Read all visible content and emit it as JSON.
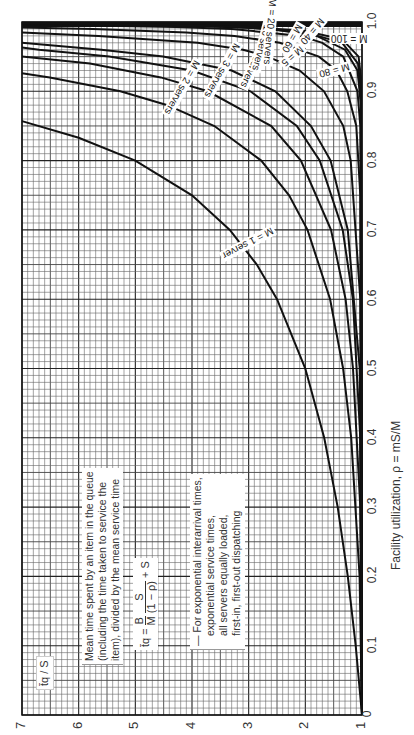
{
  "chart_data": {
    "type": "line",
    "title": "Mean time spent by an item in the queue (including the time taken to service the item), divided by the mean service time",
    "orientation": "rotated-90-ccw",
    "xlabel": "Facility utilization, ρ = mS/M",
    "ylabel": "t̄q / S",
    "xlim": [
      0,
      1.0
    ],
    "ylim": [
      1,
      7
    ],
    "x_ticks": [
      "0",
      "0.1",
      "0.2",
      "0.3",
      "0.4",
      "0.5",
      "0.6",
      "0.7",
      "0.8",
      "0.9",
      "1.0"
    ],
    "y_ticks": [
      "1",
      "2",
      "3",
      "4",
      "5",
      "6",
      "7"
    ],
    "grid": true,
    "formula": {
      "lhs": "t̄q",
      "eq": "=",
      "b_over_m_num": "B",
      "b_over_m_den": "M",
      "s_over_num": "S",
      "s_over_den": "(1 − ρ)",
      "plus": "+ S"
    },
    "assumptions": [
      "For exponential interarrival times,",
      "exponential service times,",
      "all servers equally loaded,",
      "first-in, first-out dispatching"
    ],
    "description_lines": [
      "Mean time spent by an item in the queue",
      "(including the time taken to service the",
      "item), divided by the mean service time"
    ],
    "series": [
      {
        "name": "M = 1 server",
        "label": "M = 1 server",
        "x": [
          0,
          0.1,
          0.2,
          0.3,
          0.4,
          0.5,
          0.6,
          0.65,
          0.7,
          0.75,
          0.8,
          0.833,
          0.857
        ],
        "y": [
          1,
          1.111,
          1.25,
          1.429,
          1.667,
          2.0,
          2.5,
          2.857,
          3.333,
          4.0,
          5.0,
          6.0,
          7.0
        ]
      },
      {
        "name": "M = 2 servers",
        "label": "M = 2 servers",
        "x": [
          0,
          0.2,
          0.4,
          0.5,
          0.6,
          0.7,
          0.75,
          0.8,
          0.85,
          0.88,
          0.9,
          0.92,
          0.926
        ],
        "y": [
          1,
          1.042,
          1.19,
          1.333,
          1.563,
          1.961,
          2.286,
          2.778,
          3.604,
          4.433,
          5.263,
          6.51,
          7.0
        ]
      },
      {
        "name": "M = 3 servers",
        "label": "M = 3 servers",
        "x": [
          0,
          0.3,
          0.5,
          0.6,
          0.7,
          0.8,
          0.85,
          0.9,
          0.92,
          0.94,
          0.95
        ],
        "y": [
          1,
          1.03,
          1.158,
          1.29,
          1.547,
          2.079,
          2.6,
          3.72,
          4.55,
          5.8,
          7.05
        ]
      },
      {
        "name": "M = 4 servers",
        "label": "M = 4 servers",
        "x": [
          0,
          0.4,
          0.6,
          0.7,
          0.8,
          0.85,
          0.9,
          0.93,
          0.95,
          0.96,
          0.963
        ],
        "y": [
          1,
          1.03,
          1.16,
          1.34,
          1.745,
          2.15,
          2.97,
          4.0,
          5.46,
          6.7,
          7.0
        ]
      },
      {
        "name": "M = 5",
        "label": "M = 5",
        "x": [
          0,
          0.5,
          0.7,
          0.8,
          0.85,
          0.9,
          0.93,
          0.95,
          0.96,
          0.97
        ],
        "y": [
          1,
          1.04,
          1.25,
          1.554,
          1.9,
          2.53,
          3.3,
          4.51,
          5.6,
          7.17
        ]
      },
      {
        "name": "M = 10 servers",
        "label": "M = 10 servers",
        "x": [
          0,
          0.6,
          0.8,
          0.85,
          0.9,
          0.93,
          0.95,
          0.96,
          0.97,
          0.98,
          0.985
        ],
        "y": [
          1,
          1.03,
          1.2,
          1.33,
          1.67,
          2.1,
          2.66,
          3.1,
          3.9,
          5.65,
          7.3
        ]
      },
      {
        "name": "M = 20 servers",
        "label": "M = 20 servers",
        "x": [
          0,
          0.75,
          0.85,
          0.9,
          0.93,
          0.95,
          0.97,
          0.98,
          0.985,
          0.99,
          0.992
        ],
        "y": [
          1,
          1.03,
          1.1,
          1.26,
          1.45,
          1.76,
          2.45,
          3.25,
          4.1,
          5.75,
          7.0
        ]
      },
      {
        "name": "M = 40",
        "label": "M = 40",
        "x": [
          0,
          0.85,
          0.9,
          0.95,
          0.97,
          0.98,
          0.99,
          0.993,
          0.995,
          0.996
        ],
        "y": [
          1,
          1.03,
          1.08,
          1.33,
          1.7,
          2.08,
          3.3,
          4.3,
          5.8,
          7.0
        ]
      },
      {
        "name": "M = 60",
        "label": "M = 60",
        "x": [
          0,
          0.88,
          0.93,
          0.96,
          0.98,
          0.99,
          0.994,
          0.996,
          0.997
        ],
        "y": [
          1,
          1.02,
          1.08,
          1.3,
          1.8,
          2.6,
          3.7,
          5.2,
          7.0
        ]
      },
      {
        "name": "M = 80",
        "label": "M = 80",
        "x": [
          0,
          0.9,
          0.94,
          0.97,
          0.985,
          0.992,
          0.995,
          0.997,
          0.998
        ],
        "y": [
          1,
          1.02,
          1.07,
          1.35,
          2.0,
          3.0,
          4.2,
          6.0,
          7.0
        ]
      },
      {
        "name": "M = 100",
        "label": "M = 100",
        "x": [
          0,
          0.92,
          0.95,
          0.975,
          0.987,
          0.993,
          0.996,
          0.998,
          0.9985
        ],
        "y": [
          1,
          1.02,
          1.06,
          1.35,
          2.0,
          3.0,
          4.4,
          6.5,
          7.0
        ]
      }
    ],
    "curve_labels": [
      {
        "text": "M = 1 server",
        "rho": 0.68,
        "v": 3.1,
        "angle": 62
      },
      {
        "text": "M = 2 servers",
        "rho": 0.905,
        "v": 4.3,
        "angle": 30
      },
      {
        "text": "M = 3 servers",
        "rho": 0.93,
        "v": 3.6,
        "angle": 30
      },
      {
        "text": "M = 4 servers",
        "rho": 0.945,
        "v": 3.0,
        "angle": 25
      },
      {
        "text": "M = 5",
        "rho": 0.95,
        "v": 2.05,
        "angle": 50
      },
      {
        "text": "M = 10 servers",
        "rho": 0.975,
        "v": 2.9,
        "angle": 15
      },
      {
        "text": "M = 20 servers",
        "rho": 0.985,
        "v": 2.8,
        "angle": 5
      },
      {
        "text": "M = 40",
        "rho": 0.985,
        "v": 1.75,
        "angle": 40
      },
      {
        "text": "M = 60",
        "rho": 0.975,
        "v": 2.1,
        "angle": 30
      },
      {
        "text": "M = 80",
        "rho": 0.93,
        "v": 1.35,
        "angle": 75
      },
      {
        "text": "M = 100",
        "rho": 0.975,
        "v": 1.15,
        "angle": 90
      }
    ]
  }
}
